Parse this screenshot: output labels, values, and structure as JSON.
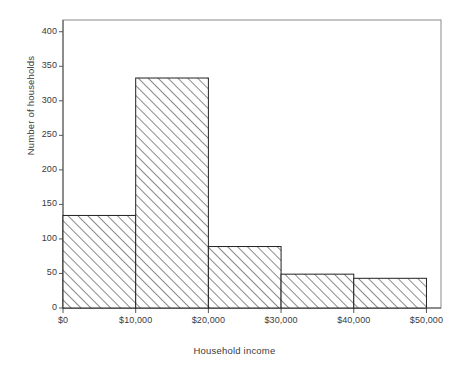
{
  "chart_data": {
    "type": "bar",
    "title": "",
    "xlabel": "Household income",
    "ylabel": "Number of households",
    "categories": [
      "$0–$10,000",
      "$10,000–$20,000",
      "$20,000–$30,000",
      "$30,000–$40,000",
      "$40,000–$50,000"
    ],
    "bin_edges": [
      0,
      10000,
      20000,
      30000,
      40000,
      50000
    ],
    "values": [
      134,
      333,
      89,
      49,
      43
    ],
    "xlim": [
      0,
      52000
    ],
    "ylim": [
      0,
      417
    ],
    "x_tick_values": [
      0,
      10000,
      20000,
      30000,
      40000,
      50000
    ],
    "x_tick_labels": [
      "$0",
      "$10,000",
      "$20,000",
      "$30,000",
      "$40,000",
      "$50,000"
    ],
    "y_tick_values": [
      0,
      50,
      100,
      150,
      200,
      250,
      300,
      350,
      400
    ],
    "y_tick_labels": [
      "0",
      "50",
      "100",
      "150",
      "200",
      "250",
      "300",
      "350",
      "400"
    ],
    "grid": false,
    "legend": null,
    "bar_fill": "hatched-diagonal",
    "bar_edge_color": "#222222",
    "hatch_color": "#2a2a2a",
    "axis_color": "#555555",
    "plot_background": "#ffffff"
  },
  "axes": {
    "y_title": "Number of households",
    "x_title": "Household income"
  }
}
